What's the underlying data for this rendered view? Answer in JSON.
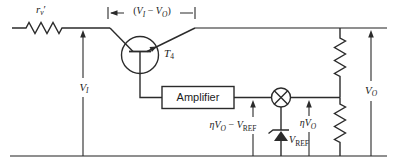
{
  "figure": {
    "background": "#ffffff",
    "ink": "#2b2b2b",
    "rail_color": "#8f8f8f"
  },
  "labels": {
    "series_resistor": [
      {
        "t": "r",
        "i": 1
      },
      {
        "t": "v",
        "i": 1,
        "s": 1
      },
      {
        "t": "′"
      }
    ],
    "collector_emitter_drop": [
      {
        "t": "("
      },
      {
        "t": "V",
        "i": 1
      },
      {
        "t": "I",
        "i": 1,
        "s": 1
      },
      {
        "t": " − "
      },
      {
        "t": "V",
        "i": 1
      },
      {
        "t": "O",
        "i": 1,
        "s": 1
      },
      {
        "t": ")"
      }
    ],
    "transistor": [
      {
        "t": "T",
        "i": 1
      },
      {
        "t": "4",
        "s": 1
      }
    ],
    "input_voltage": [
      {
        "t": "V",
        "i": 1
      },
      {
        "t": "I",
        "i": 1,
        "s": 1
      }
    ],
    "amplifier": "Amplifier",
    "feedback_minus_ref": [
      {
        "t": "η",
        "i": 1
      },
      {
        "t": "V",
        "i": 1
      },
      {
        "t": "O",
        "i": 1,
        "s": 1
      },
      {
        "t": " − "
      },
      {
        "t": "V",
        "i": 1
      },
      {
        "t": "REF",
        "s": 1
      }
    ],
    "zener_ref": [
      {
        "t": "V",
        "i": 1
      },
      {
        "t": "REF",
        "s": 1
      }
    ],
    "feedback_voltage": [
      {
        "t": "η",
        "i": 1
      },
      {
        "t": "V",
        "i": 1
      },
      {
        "t": "O",
        "i": 1,
        "s": 1
      }
    ],
    "output_voltage": [
      {
        "t": "V",
        "i": 1
      },
      {
        "t": "O",
        "i": 1,
        "s": 1
      }
    ]
  }
}
